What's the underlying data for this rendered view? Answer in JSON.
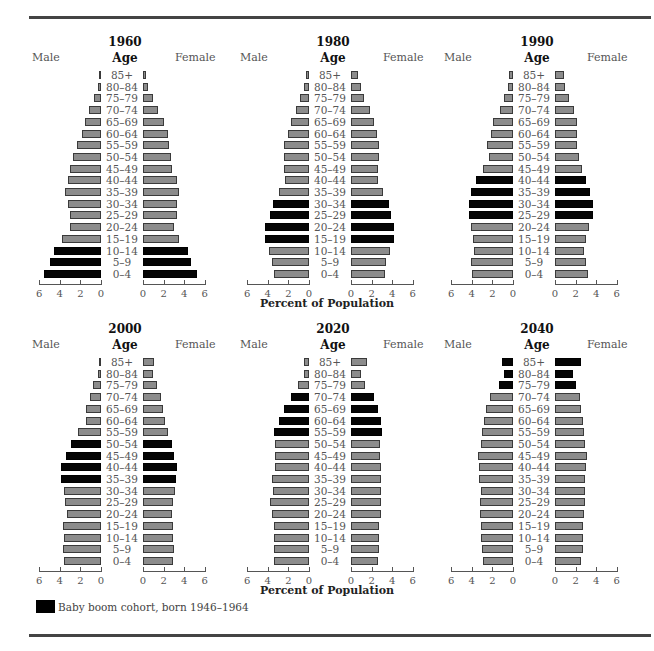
{
  "chart_data": [
    {
      "type": "bar",
      "title": "1960",
      "orientation": "horizontal-population-pyramid",
      "categories": [
        "85+",
        "80–84",
        "75–79",
        "70–74",
        "65–69",
        "60–64",
        "55–59",
        "50–54",
        "45–49",
        "40–44",
        "35–39",
        "30–34",
        "25–29",
        "20–24",
        "15–19",
        "10–14",
        "5–9",
        "0–4"
      ],
      "series": [
        {
          "name": "Male",
          "values": [
            0.2,
            0.3,
            0.7,
            1.2,
            1.6,
            1.8,
            2.3,
            2.7,
            3.0,
            3.2,
            3.5,
            3.2,
            3.0,
            3.0,
            3.8,
            4.6,
            5.0,
            5.5
          ]
        },
        {
          "name": "Female",
          "values": [
            0.3,
            0.5,
            1.0,
            1.5,
            2.0,
            2.4,
            2.5,
            2.7,
            2.8,
            3.3,
            3.5,
            3.3,
            3.3,
            3.0,
            3.5,
            4.4,
            4.7,
            5.2
          ]
        }
      ],
      "boom_rows": [
        "10–14",
        "5–9",
        "0–4"
      ],
      "xlabel": "",
      "ylabel": "Age",
      "xlim": [
        0,
        6
      ]
    },
    {
      "type": "bar",
      "title": "1980",
      "orientation": "horizontal-population-pyramid",
      "categories": [
        "85+",
        "80–84",
        "75–79",
        "70–74",
        "65–69",
        "60–64",
        "55–59",
        "50–54",
        "45–49",
        "40–44",
        "35–39",
        "30–34",
        "25–29",
        "20–24",
        "15–19",
        "10–14",
        "5–9",
        "0–4"
      ],
      "series": [
        {
          "name": "Male",
          "values": [
            0.3,
            0.5,
            0.9,
            1.3,
            1.7,
            2.0,
            2.4,
            2.4,
            2.4,
            2.3,
            2.9,
            3.5,
            3.8,
            4.3,
            4.3,
            3.9,
            3.6,
            3.4
          ]
        },
        {
          "name": "Female",
          "values": [
            0.7,
            1.0,
            1.3,
            1.8,
            2.2,
            2.5,
            2.7,
            2.7,
            2.6,
            2.6,
            3.1,
            3.7,
            3.9,
            4.2,
            4.2,
            3.8,
            3.4,
            3.3
          ]
        }
      ],
      "boom_rows": [
        "30–34",
        "25–29",
        "20–24",
        "15–19"
      ],
      "xlabel": "Percent of Population",
      "ylabel": "Age",
      "xlim": [
        0,
        6
      ]
    },
    {
      "type": "bar",
      "title": "1990",
      "orientation": "horizontal-population-pyramid",
      "categories": [
        "85+",
        "80–84",
        "75–79",
        "70–74",
        "65–69",
        "60–64",
        "55–59",
        "50–54",
        "45–49",
        "40–44",
        "35–39",
        "30–34",
        "25–29",
        "20–24",
        "15–19",
        "10–14",
        "5–9",
        "0–4"
      ],
      "series": [
        {
          "name": "Male",
          "values": [
            0.4,
            0.5,
            0.9,
            1.3,
            1.9,
            2.1,
            2.5,
            2.3,
            2.9,
            3.6,
            4.1,
            4.3,
            4.3,
            4.1,
            3.9,
            3.8,
            4.1,
            4.0
          ]
        },
        {
          "name": "Female",
          "values": [
            0.9,
            1.0,
            1.4,
            1.8,
            2.1,
            2.1,
            2.1,
            2.3,
            2.6,
            3.0,
            3.4,
            3.7,
            3.7,
            3.3,
            3.0,
            2.8,
            3.0,
            3.2
          ]
        }
      ],
      "boom_rows": [
        "40–44",
        "35–39",
        "30–34",
        "25–29"
      ],
      "xlabel": "",
      "ylabel": "Age",
      "xlim": [
        0,
        6
      ]
    },
    {
      "type": "bar",
      "title": "2000",
      "orientation": "horizontal-population-pyramid",
      "categories": [
        "85+",
        "80–84",
        "75–79",
        "70–74",
        "65–69",
        "60–64",
        "55–59",
        "50–54",
        "45–49",
        "40–44",
        "35–39",
        "30–34",
        "25–29",
        "20–24",
        "15–19",
        "10–14",
        "5–9",
        "0–4"
      ],
      "series": [
        {
          "name": "Male",
          "values": [
            0.2,
            0.3,
            0.8,
            1.1,
            1.5,
            1.5,
            2.2,
            2.9,
            3.4,
            3.9,
            3.9,
            3.6,
            3.5,
            3.3,
            3.7,
            3.6,
            3.7,
            3.6
          ]
        },
        {
          "name": "Female",
          "values": [
            1.1,
            1.0,
            1.4,
            1.7,
            1.9,
            2.1,
            2.4,
            2.8,
            3.0,
            3.3,
            3.2,
            3.1,
            2.9,
            2.8,
            2.9,
            2.9,
            3.0,
            2.9
          ]
        }
      ],
      "boom_rows": [
        "50–54",
        "45–49",
        "40–44",
        "35–39"
      ],
      "xlabel": "",
      "ylabel": "Age",
      "xlim": [
        0,
        6
      ]
    },
    {
      "type": "bar",
      "title": "2020",
      "orientation": "horizontal-population-pyramid",
      "categories": [
        "85+",
        "80–84",
        "75–79",
        "70–74",
        "65–69",
        "60–64",
        "55–59",
        "50–54",
        "45–49",
        "40–44",
        "35–39",
        "30–34",
        "25–29",
        "20–24",
        "15–19",
        "10–14",
        "5–9",
        "0–4"
      ],
      "series": [
        {
          "name": "Male",
          "values": [
            0.5,
            0.5,
            1.1,
            1.7,
            2.4,
            2.9,
            3.4,
            3.3,
            3.3,
            3.3,
            3.6,
            3.5,
            3.8,
            3.6,
            3.4,
            3.4,
            3.4,
            3.4
          ]
        },
        {
          "name": "Female",
          "values": [
            1.6,
            1.0,
            1.4,
            2.2,
            2.6,
            2.9,
            3.0,
            2.8,
            2.8,
            2.9,
            2.9,
            2.9,
            2.9,
            2.9,
            2.7,
            2.7,
            2.7,
            2.6
          ]
        }
      ],
      "boom_rows": [
        "70–74",
        "65–69",
        "60–64",
        "55–59"
      ],
      "xlabel": "Percent of Population",
      "ylabel": "Age",
      "xlim": [
        0,
        6
      ]
    },
    {
      "type": "bar",
      "title": "2040",
      "orientation": "horizontal-population-pyramid",
      "categories": [
        "85+",
        "80–84",
        "75–79",
        "70–74",
        "65–69",
        "60–64",
        "55–59",
        "50–54",
        "45–49",
        "40–44",
        "35–39",
        "30–34",
        "25–29",
        "20–24",
        "15–19",
        "10–14",
        "5–9",
        "0–4"
      ],
      "series": [
        {
          "name": "Male",
          "values": [
            1.1,
            0.9,
            1.4,
            2.2,
            2.6,
            2.8,
            3.0,
            3.1,
            3.4,
            3.3,
            3.3,
            3.1,
            3.2,
            3.2,
            3.1,
            3.1,
            3.0,
            2.9
          ]
        },
        {
          "name": "Female",
          "values": [
            2.5,
            1.7,
            2.0,
            2.4,
            2.5,
            2.7,
            2.8,
            2.9,
            3.1,
            3.0,
            2.9,
            2.9,
            2.9,
            2.8,
            2.7,
            2.7,
            2.7,
            2.5
          ]
        }
      ],
      "boom_rows": [
        "85+",
        "80–84",
        "75–79"
      ],
      "xlabel": "",
      "ylabel": "Age",
      "xlim": [
        0,
        6
      ]
    }
  ],
  "labels": {
    "male": "Male",
    "female": "Female",
    "age": "Age",
    "x_axis_title": "Percent of Population",
    "ticks_male": [
      "6",
      "4",
      "2",
      "0"
    ],
    "ticks_female": [
      "0",
      "2",
      "4",
      "6"
    ]
  },
  "legend": {
    "swatch_color": "#000000",
    "text": "Baby boom cohort, born 1946–1964"
  },
  "colors": {
    "bar_gray": "#8c8c8c",
    "bar_boom": "#050505",
    "rule": "#444444"
  }
}
